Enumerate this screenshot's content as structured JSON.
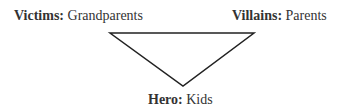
{
  "diagram": {
    "type": "drama-triangle",
    "nodes": [
      {
        "role": "Victims:",
        "value": "Grandparents"
      },
      {
        "role": "Villains:",
        "value": "Parents"
      },
      {
        "role": "Hero:",
        "value": "Kids"
      }
    ],
    "line_color": "#222222"
  }
}
